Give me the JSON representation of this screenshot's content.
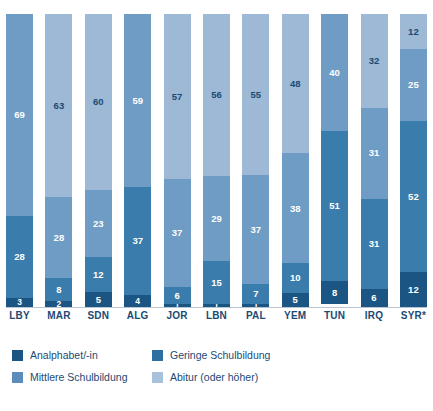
{
  "chart_data": {
    "type": "bar",
    "subtype": "stacked-100-percent",
    "title": "",
    "xlabel": "",
    "ylabel": "",
    "ylim": [
      0,
      100
    ],
    "grid": false,
    "legend_position": "bottom-left",
    "categories": [
      "LBY",
      "MAR",
      "SDN",
      "ALG",
      "JOR",
      "LBN",
      "PAL",
      "YEM",
      "TUN",
      "IRQ",
      "SYR*"
    ],
    "series": [
      {
        "name": "Analphabet/-in",
        "color": "#1b5584",
        "values": [
          3,
          2,
          5,
          4,
          1,
          1,
          1,
          5,
          8,
          6,
          12
        ]
      },
      {
        "name": "Geringe Schulbildung",
        "color": "#3a7cab",
        "values": [
          28,
          8,
          12,
          37,
          6,
          15,
          7,
          10,
          51,
          31,
          52
        ]
      },
      {
        "name": "Mittlere Schulbildung",
        "color": "#6e9cc4",
        "values": [
          69,
          28,
          23,
          59,
          37,
          29,
          37,
          38,
          40,
          31,
          25
        ]
      },
      {
        "name": "Abitur (oder höher)",
        "color": "#9db9d5",
        "values": [
          0,
          63,
          60,
          0,
          57,
          56,
          55,
          48,
          0,
          32,
          12
        ]
      }
    ],
    "bars": [
      {
        "category": "LBY",
        "segments": [
          {
            "series": "Analphabet/-in",
            "value": 3
          },
          {
            "series": "Geringe Schulbildung",
            "value": 28
          },
          {
            "series": "Mittlere Schulbildung",
            "value": 69
          }
        ]
      },
      {
        "category": "MAR",
        "segments": [
          {
            "series": "Analphabet/-in",
            "value": 2
          },
          {
            "series": "Geringe Schulbildung",
            "value": 8
          },
          {
            "series": "Mittlere Schulbildung",
            "value": 28
          },
          {
            "series": "Abitur (oder höher)",
            "value": 63
          }
        ]
      },
      {
        "category": "SDN",
        "segments": [
          {
            "series": "Analphabet/-in",
            "value": 5
          },
          {
            "series": "Geringe Schulbildung",
            "value": 12
          },
          {
            "series": "Mittlere Schulbildung",
            "value": 23
          },
          {
            "series": "Abitur (oder höher)",
            "value": 60
          }
        ]
      },
      {
        "category": "ALG",
        "segments": [
          {
            "series": "Analphabet/-in",
            "value": 4
          },
          {
            "series": "Geringe Schulbildung",
            "value": 37
          },
          {
            "series": "Mittlere Schulbildung",
            "value": 59
          }
        ]
      },
      {
        "category": "JOR",
        "segments": [
          {
            "series": "Analphabet/-in",
            "value": 1
          },
          {
            "series": "Geringe Schulbildung",
            "value": 6
          },
          {
            "series": "Mittlere Schulbildung",
            "value": 37
          },
          {
            "series": "Abitur (oder höher)",
            "value": 57
          }
        ]
      },
      {
        "category": "LBN",
        "segments": [
          {
            "series": "Analphabet/-in",
            "value": 1
          },
          {
            "series": "Geringe Schulbildung",
            "value": 15
          },
          {
            "series": "Mittlere Schulbildung",
            "value": 29
          },
          {
            "series": "Abitur (oder höher)",
            "value": 56
          }
        ]
      },
      {
        "category": "PAL",
        "segments": [
          {
            "series": "Analphabet/-in",
            "value": 1
          },
          {
            "series": "Geringe Schulbildung",
            "value": 7
          },
          {
            "series": "Mittlere Schulbildung",
            "value": 37
          },
          {
            "series": "Abitur (oder höher)",
            "value": 55
          }
        ]
      },
      {
        "category": "YEM",
        "segments": [
          {
            "series": "Analphabet/-in",
            "value": 5
          },
          {
            "series": "Geringe Schulbildung",
            "value": 10
          },
          {
            "series": "Mittlere Schulbildung",
            "value": 38
          },
          {
            "series": "Abitur (oder höher)",
            "value": 48
          }
        ]
      },
      {
        "category": "TUN",
        "segments": [
          {
            "series": "Analphabet/-in",
            "value": 8
          },
          {
            "series": "Geringe Schulbildung",
            "value": 51
          },
          {
            "series": "Mittlere Schulbildung",
            "value": 40
          }
        ]
      },
      {
        "category": "IRQ",
        "segments": [
          {
            "series": "Analphabet/-in",
            "value": 6
          },
          {
            "series": "Geringe Schulbildung",
            "value": 31
          },
          {
            "series": "Mittlere Schulbildung",
            "value": 31
          },
          {
            "series": "Abitur (oder höher)",
            "value": 32
          }
        ]
      },
      {
        "category": "SYR*",
        "segments": [
          {
            "series": "Analphabet/-in",
            "value": 12
          },
          {
            "series": "Geringe Schulbildung",
            "value": 52
          },
          {
            "series": "Mittlere Schulbildung",
            "value": 25
          },
          {
            "series": "Abitur (oder höher)",
            "value": 12
          }
        ]
      }
    ]
  },
  "legend": {
    "items": [
      {
        "label": "Analphabet/-in",
        "color": "#1b5584",
        "swatch_class": "s0"
      },
      {
        "label": "Geringe Schulbildung",
        "color": "#2f6f9f",
        "swatch_class": "s1"
      },
      {
        "label": "Mittlere Schulbildung",
        "color": "#5b8cbb",
        "swatch_class": "s2"
      },
      {
        "label": "Abitur (oder höher)",
        "color": "#a8c2dc",
        "swatch_class": "s3"
      }
    ]
  }
}
